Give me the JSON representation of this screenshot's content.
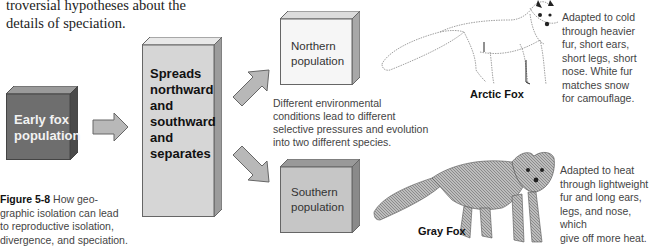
{
  "intro_text": {
    "line1": "troversial hypotheses about the",
    "line2": "details of speciation."
  },
  "diagram": {
    "early_population": {
      "line1": "Early fox",
      "line2": "population"
    },
    "spreads_box": {
      "lines": [
        "Spreads",
        "northward",
        "and",
        "southward",
        "and",
        "separates"
      ]
    },
    "northern_population": {
      "line1": "Northern",
      "line2": "population"
    },
    "southern_population": {
      "line1": "Southern",
      "line2": "population"
    },
    "environment_note": {
      "lines": [
        "Different environmental",
        "conditions lead to different",
        "selective pressures and evolution",
        "into two different species."
      ]
    },
    "arctic_fox": {
      "label": "Arctic Fox",
      "description": [
        "Adapted to cold",
        "through heavier",
        "fur, short ears,",
        "short legs, short",
        "nose. White fur",
        "matches snow",
        "for camouflage."
      ]
    },
    "gray_fox": {
      "label": "Gray Fox",
      "description": [
        "Adapted to heat",
        "through lightweight",
        "fur and long ears,",
        "legs, and nose, which",
        "give off more heat."
      ]
    }
  },
  "caption": {
    "label": "Figure 5-8",
    "text_line1": " How geo-",
    "lines": [
      "graphic isolation can lead",
      "to reproductive isolation,",
      "divergence, and speciation."
    ]
  },
  "colors": {
    "early_box": "#6e6e6e",
    "spreads_box": "#d4d4d4",
    "northern_box": "#f4f4f4",
    "southern_box": "#c4c4c4",
    "arrow_fill": "#b8b8b8"
  }
}
